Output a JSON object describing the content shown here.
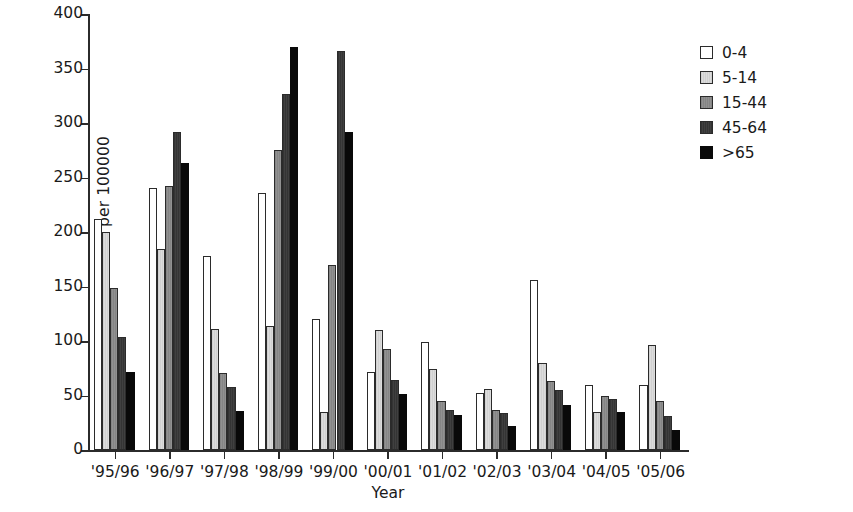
{
  "chart_data": {
    "type": "bar",
    "title": "",
    "xlabel": "Year",
    "ylabel": "Maximum rate per 100000",
    "ylim": [
      0,
      400
    ],
    "yticks": [
      0,
      50,
      100,
      150,
      200,
      250,
      300,
      350,
      400
    ],
    "grid": false,
    "legend_position": "top-right",
    "categories": [
      "'95/96",
      "'96/97",
      "'97/98",
      "'98/99",
      "'99/00",
      "'00/01",
      "'01/02",
      "'02/03",
      "'03/04",
      "'04/05",
      "'05/06"
    ],
    "series": [
      {
        "name": "0-4",
        "color": "#ffffff",
        "values": [
          212,
          240,
          178,
          236,
          120,
          72,
          99,
          52,
          156,
          60,
          60
        ]
      },
      {
        "name": "5-14",
        "color": "#d4d4d4",
        "values": [
          200,
          184,
          111,
          114,
          35,
          110,
          74,
          56,
          80,
          35,
          96
        ]
      },
      {
        "name": "15-44",
        "color": "#8a8a8a",
        "values": [
          149,
          242,
          71,
          275,
          170,
          93,
          45,
          37,
          63,
          50,
          45
        ]
      },
      {
        "name": "45-64",
        "color": "#3a3a3a",
        "values": [
          104,
          292,
          58,
          327,
          366,
          64,
          37,
          34,
          55,
          47,
          31
        ]
      },
      {
        "name": ">65",
        "color": "#090909",
        "values": [
          72,
          263,
          36,
          370,
          292,
          51,
          32,
          22,
          41,
          35,
          18
        ]
      }
    ]
  }
}
